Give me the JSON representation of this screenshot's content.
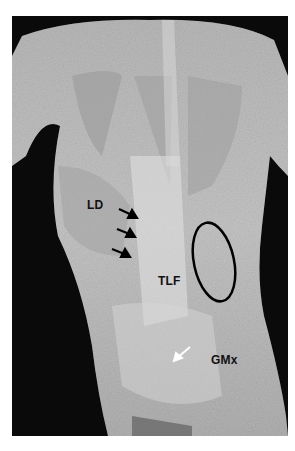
{
  "figure": {
    "background_color": "#0a0a0a",
    "tissue_color": "#bdbdbd",
    "labels": [
      {
        "id": "ld",
        "text": "LD",
        "x": 87,
        "y": 198
      },
      {
        "id": "tlf",
        "text": "TLF",
        "x": 158,
        "y": 274
      },
      {
        "id": "gmx",
        "text": "GMx",
        "x": 211,
        "y": 353
      }
    ],
    "annotations": {
      "black_arrows": 3,
      "white_arrows": 1,
      "ellipse": {
        "cx": 214,
        "cy": 262,
        "rx": 20,
        "ry": 40,
        "stroke": "#000000"
      }
    }
  }
}
